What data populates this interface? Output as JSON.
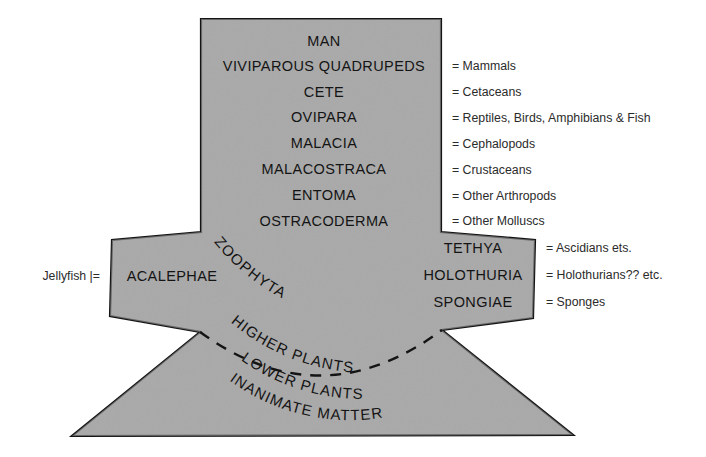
{
  "figure": {
    "kind": "scala-naturae-diagram",
    "fill_color": "#a9a9a9",
    "outline_color": "#141414",
    "background_color": "#ffffff",
    "dashed_arc_color": "#141414"
  },
  "column": {
    "rows": [
      {
        "term": "MAN",
        "gloss": ""
      },
      {
        "term": "VIVIPAROUS QUADRUPEDS",
        "gloss": "= Mammals"
      },
      {
        "term": "CETE",
        "gloss": "= Cetaceans"
      },
      {
        "term": "OVIPARA",
        "gloss": "= Reptiles, Birds, Amphibians & Fish"
      },
      {
        "term": "MALACIA",
        "gloss": "= Cephalopods"
      },
      {
        "term": "MALACOSTRACA",
        "gloss": "= Crustaceans"
      },
      {
        "term": "ENTOMA",
        "gloss": "= Other Arthropods"
      },
      {
        "term": "OSTRACODERMA",
        "gloss": "= Other Molluscs"
      }
    ]
  },
  "band": {
    "left_term": "ACALEPHAE",
    "left_gloss": "Jellyfish |=",
    "right_rows": [
      {
        "term": "TETHYA",
        "gloss": "= Ascidians ets."
      },
      {
        "term": "HOLOTHURIA",
        "gloss": "= Holothurians?? etc."
      },
      {
        "term": "SPONGIAE",
        "gloss": "= Sponges"
      }
    ]
  },
  "arcs": {
    "curved_terms": [
      "ZOOPHYTA",
      "HIGHER PLANTS",
      "LOWER PLANTS",
      "INANIMATE MATTER"
    ]
  }
}
